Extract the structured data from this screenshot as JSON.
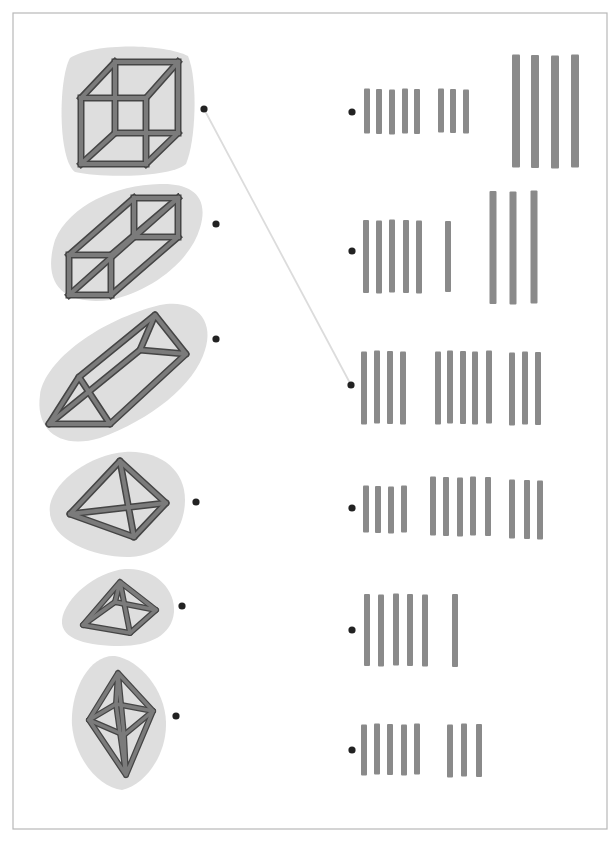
{
  "worksheet": {
    "title": "Match each 3D shape to its tally count",
    "colors": {
      "page_border": "#b8b8b8",
      "blob_fill": "#dedede",
      "beam_outline": "#454545",
      "beam_fill": "#7b7b7b",
      "tally": "#8a8a8a",
      "dot": "#222222",
      "connector_line": "#dcdcdc"
    },
    "shapes": [
      {
        "name": "cube",
        "dot": [
          204,
          109
        ]
      },
      {
        "name": "rectangular-prism",
        "dot": [
          216,
          224
        ]
      },
      {
        "name": "triangular-prism",
        "dot": [
          216,
          339
        ]
      },
      {
        "name": "tetrahedron",
        "dot": [
          196,
          502
        ]
      },
      {
        "name": "square-pyramid",
        "dot": [
          182,
          606
        ]
      },
      {
        "name": "octahedron",
        "dot": [
          176,
          716
        ]
      }
    ],
    "tallies": [
      {
        "dot": [
          352,
          112
        ],
        "total": 12,
        "groups": [
          {
            "count": 5,
            "xs": [
              367,
              379,
              392,
              405,
              417
            ],
            "y1": 89,
            "y2": 134,
            "w": 6
          },
          {
            "count": 3,
            "xs": [
              441,
              453,
              466
            ],
            "y1": 89,
            "y2": 133,
            "w": 6
          },
          {
            "count": 4,
            "xs": [
              516,
              535,
              555,
              575
            ],
            "y1": 55,
            "y2": 168,
            "w": 8
          }
        ]
      },
      {
        "dot": [
          352,
          251
        ],
        "total": 9,
        "groups": [
          {
            "count": 5,
            "xs": [
              366,
              379,
              392,
              406,
              419
            ],
            "y1": 220,
            "y2": 293,
            "w": 6
          },
          {
            "count": 1,
            "xs": [
              448
            ],
            "y1": 221,
            "y2": 292,
            "w": 6
          },
          {
            "count": 3,
            "xs": [
              493,
              513,
              534
            ],
            "y1": 191,
            "y2": 304,
            "w": 7
          }
        ]
      },
      {
        "dot": [
          351,
          385
        ],
        "total": 12,
        "groups": [
          {
            "count": 4,
            "xs": [
              364,
              377,
              390,
              403
            ],
            "y1": 351,
            "y2": 424,
            "w": 6
          },
          {
            "count": 5,
            "xs": [
              438,
              450,
              463,
              475,
              489
            ],
            "y1": 351,
            "y2": 424,
            "w": 6
          },
          {
            "count": 3,
            "xs": [
              512,
              525,
              538
            ],
            "y1": 352,
            "y2": 425,
            "w": 6
          }
        ]
      },
      {
        "dot": [
          352,
          508
        ],
        "total": 12,
        "groups": [
          {
            "count": 4,
            "xs": [
              366,
              378,
              391,
              404
            ],
            "y1": 486,
            "y2": 533,
            "w": 6
          },
          {
            "count": 5,
            "xs": [
              433,
              446,
              460,
              473,
              488
            ],
            "y1": 477,
            "y2": 536,
            "w": 6
          },
          {
            "count": 3,
            "xs": [
              512,
              527,
              540
            ],
            "y1": 480,
            "y2": 539,
            "w": 6
          }
        ]
      },
      {
        "dot": [
          352,
          630
        ],
        "total": 6,
        "groups": [
          {
            "count": 5,
            "xs": [
              367,
              381,
              396,
              410,
              425
            ],
            "y1": 594,
            "y2": 666,
            "w": 6
          },
          {
            "count": 1,
            "xs": [
              455
            ],
            "y1": 594,
            "y2": 667,
            "w": 6
          }
        ]
      },
      {
        "dot": [
          352,
          750
        ],
        "total": 8,
        "groups": [
          {
            "count": 5,
            "xs": [
              364,
              377,
              390,
              404,
              417
            ],
            "y1": 724,
            "y2": 775,
            "w": 6
          },
          {
            "count": 3,
            "xs": [
              450,
              464,
              479
            ],
            "y1": 724,
            "y2": 777,
            "w": 6
          }
        ]
      }
    ],
    "connections": [
      {
        "from_shape": "cube",
        "to_tally_index": 2,
        "line": [
          [
            204,
            109
          ],
          [
            351,
            385
          ]
        ]
      }
    ]
  }
}
